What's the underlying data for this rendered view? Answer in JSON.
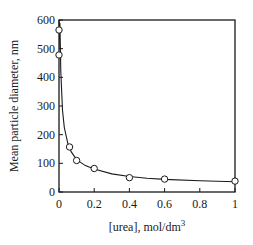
{
  "chart_data": {
    "type": "scatter",
    "title": "",
    "xlabel": "[urea], mol/dm",
    "xlabel_superscript": "3",
    "ylabel": "Mean particle diameter, nm",
    "xlim": [
      0,
      1
    ],
    "ylim": [
      0,
      600
    ],
    "x_ticks": [
      "0",
      "0.2",
      "0.4",
      "0.6",
      "0.8",
      "1"
    ],
    "y_ticks": [
      "0",
      "100",
      "200",
      "300",
      "400",
      "500",
      "600"
    ],
    "grid": false,
    "legend": null,
    "series": [
      {
        "name": "measured",
        "marker": "open-circle",
        "x": [
          0,
          0,
          0.06,
          0.1,
          0.2,
          0.4,
          0.6,
          1.0
        ],
        "y": [
          565,
          478,
          157,
          110,
          82,
          50,
          45,
          38
        ]
      },
      {
        "name": "fit",
        "style": "solid-line",
        "x": [
          0.005,
          0.01,
          0.02,
          0.03,
          0.05,
          0.07,
          0.1,
          0.15,
          0.2,
          0.3,
          0.4,
          0.5,
          0.6,
          0.8,
          1.0
        ],
        "y": [
          590,
          420,
          285,
          225,
          170,
          140,
          113,
          92,
          80,
          63,
          54,
          48,
          44,
          39,
          36
        ]
      }
    ]
  }
}
